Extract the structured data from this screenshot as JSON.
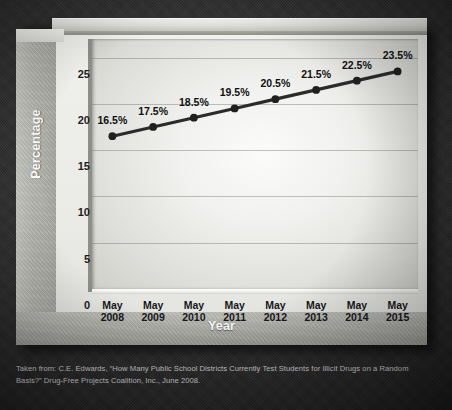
{
  "chart_data": {
    "type": "line",
    "title": "",
    "xlabel": "Year",
    "ylabel": "Percentage",
    "categories": [
      "May 2008",
      "May 2009",
      "May 2010",
      "May 2011",
      "May 2012",
      "May 2013",
      "May 2014",
      "May 2015"
    ],
    "category_lines": [
      [
        "May",
        "2008"
      ],
      [
        "May",
        "2009"
      ],
      [
        "May",
        "2010"
      ],
      [
        "May",
        "2011"
      ],
      [
        "May",
        "2012"
      ],
      [
        "May",
        "2013"
      ],
      [
        "May",
        "2014"
      ],
      [
        "May",
        "2015"
      ]
    ],
    "values": [
      16.5,
      17.5,
      18.5,
      19.5,
      20.5,
      21.5,
      22.5,
      23.5
    ],
    "point_labels": [
      "16.5%",
      "17.5%",
      "18.5%",
      "19.5%",
      "20.5%",
      "21.5%",
      "22.5%",
      "23.5%"
    ],
    "ylim": [
      0,
      27
    ],
    "yticks": [
      25,
      20,
      15,
      10,
      5,
      0
    ],
    "ytick_labels": [
      "25",
      "20",
      "15",
      "10",
      "5",
      "0"
    ],
    "grid": true,
    "legend": "none",
    "series_color": "#2b2b2b",
    "marker_color": "#202020",
    "plot_bg": "#f1f1ef",
    "panel_bg": "#eaeae7",
    "page_bg": "#2d2d2d"
  },
  "caption": {
    "text": "Taken from: C.E. Edwards, “How Many Public School Districts Currently Test Students for Illicit Drugs on a Random Basis?” Drug-Free Projects Coalition, Inc., June 2008."
  }
}
